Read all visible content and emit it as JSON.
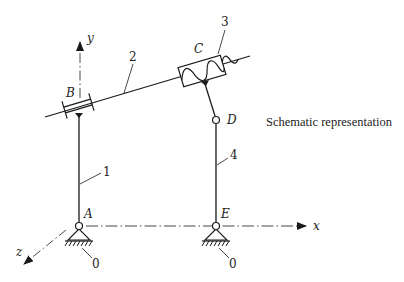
{
  "diagram": {
    "caption": "Schematic representation",
    "axes": {
      "x": "x",
      "y": "y",
      "z": "z"
    },
    "joints": {
      "A": "A",
      "B": "B",
      "C": "C",
      "D": "D",
      "E": "E"
    },
    "links": {
      "l1": "1",
      "l2": "2",
      "l3": "3",
      "l4": "4"
    },
    "grounds": {
      "g1": "0",
      "g2": "0"
    },
    "colors": {
      "stroke": "#1a1a1a",
      "background": "#ffffff"
    }
  }
}
